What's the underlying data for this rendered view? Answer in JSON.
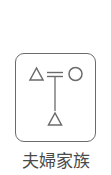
{
  "icon": {
    "name": "married-couple-family-kinship-diagram",
    "stroke_color": "#6b6b6b",
    "symbols": [
      {
        "type": "triangle",
        "meaning": "male",
        "position": "top-left"
      },
      {
        "type": "double-line",
        "meaning": "marriage",
        "position": "top-center"
      },
      {
        "type": "circle",
        "meaning": "female",
        "position": "top-right"
      },
      {
        "type": "vertical-line",
        "meaning": "descent",
        "position": "center"
      },
      {
        "type": "triangle",
        "meaning": "male-child",
        "position": "bottom-center"
      }
    ]
  },
  "caption": {
    "label": "夫婦家族",
    "color": "#4a4a4a"
  }
}
